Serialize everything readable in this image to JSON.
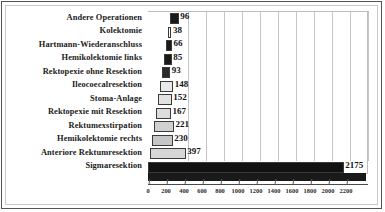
{
  "chart_data": {
    "type": "bar",
    "orientation": "horizontal",
    "title": "",
    "subtitle": "",
    "xlabel": "",
    "ylabel": "",
    "xlim": [
      0,
      2200
    ],
    "xtick_step": 200,
    "grid": true,
    "legend": "none",
    "style": "3d-horizontal-bar",
    "categories": [
      "Andere Operationen",
      "Kolektomie",
      "Hartmann-Wiederanschluss",
      "Hemikolektomie  links",
      "Rektopexie ohne Resektion",
      "Ileocoecalresektion",
      "Stoma-Anlage",
      "Rektopexie mit Resektion",
      "Rektumexstirpation",
      "Hemikolektomie  rechts",
      "Anteriore Rektumresektion",
      "Sigmaresektion"
    ],
    "values": [
      96,
      38,
      66,
      85,
      93,
      148,
      152,
      167,
      221,
      230,
      397,
      2175
    ],
    "value_labels": [
      "96",
      "38",
      "66",
      "85",
      "93",
      "148",
      "152",
      "167",
      "221",
      "230",
      "397",
      "2175"
    ],
    "xticks": [
      0,
      200,
      400,
      600,
      800,
      1000,
      1200,
      1400,
      1600,
      1800,
      2000,
      2200
    ],
    "xtick_labels": [
      "0",
      "200",
      "400",
      "600",
      "800",
      "1000",
      "1200",
      "1400",
      "1600",
      "1800",
      "2000",
      "2200"
    ],
    "bar_colors": [
      "#1a1a1a",
      "#ffffff",
      "#1a1a1a",
      "#1a1a1a",
      "#2a2a2a",
      "#e8e8e8",
      "#e2e2e2",
      "#dcdcdc",
      "#d0d0d0",
      "#c6c6c6",
      "#d6d6d6",
      "#121212"
    ],
    "colors": {
      "background": "#ffffff",
      "gridline": "#c4c4c4",
      "axis": "#4a4a4a",
      "text": "#1b1b1b",
      "border_outer": "#555555",
      "border_inner": "#c9c9c9"
    }
  }
}
